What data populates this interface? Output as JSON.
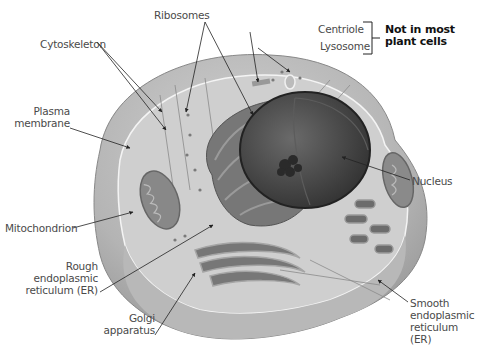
{
  "diagram": {
    "labels": {
      "ribosomes": "Ribosomes",
      "cytoskeleton": "Cytoskeleton",
      "centriole": "Centriole",
      "lysosome": "Lysosome",
      "not_in_plant_line1": "Not in most",
      "not_in_plant_line2": "plant cells",
      "plasma_line1": "Plasma",
      "plasma_line2": "membrane",
      "nucleus": "Nucleus",
      "mitochondrion": "Mitochondrion",
      "rough_er_line1": "Rough",
      "rough_er_line2": "endoplasmic",
      "rough_er_line3": "reticulum (ER)",
      "smooth_er_line1": "Smooth",
      "smooth_er_line2": "endoplasmic",
      "smooth_er_line3": "reticulum (ER)",
      "golgi_line1": "Golgi",
      "golgi_line2": "apparatus"
    },
    "colors": {
      "cell_outer": "#a9a9a9",
      "cytoplasm": "#c9c9c9",
      "nucleus": "#4a4a4a",
      "er": "#6e6e6e",
      "leader": "#222222",
      "label_text": "#4a4a4a"
    }
  }
}
